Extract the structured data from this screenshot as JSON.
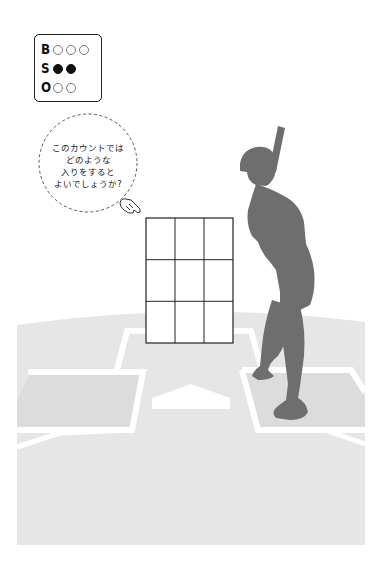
{
  "count_indicator": {
    "rows": [
      {
        "letter": "B",
        "label": "ball",
        "total": 3,
        "lit": 0
      },
      {
        "letter": "S",
        "label": "strike",
        "total": 2,
        "lit": 2
      },
      {
        "letter": "O",
        "label": "out",
        "total": 2,
        "lit": 0
      }
    ]
  },
  "speech_bubble": {
    "lines": [
      "このカウントでは",
      "どのような",
      "入りをすると",
      "よいでしょうか?"
    ]
  },
  "strike_zone": {
    "rows": 3,
    "cols": 3
  },
  "colors": {
    "field": "#e6e6e6",
    "batters_box": "#dcdcdc",
    "chalk": "#ffffff",
    "batter": "#6e6e6e",
    "grid_line": "#222222",
    "lamp_on": "#111111"
  },
  "icons": {
    "pointer": "pointing-hand-icon"
  }
}
